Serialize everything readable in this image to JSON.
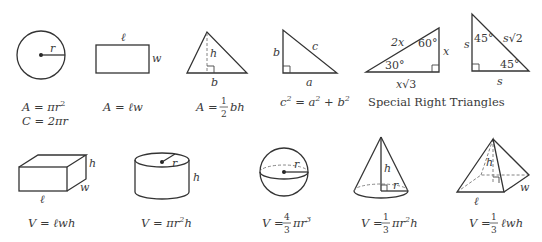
{
  "stroke_color": "#333333",
  "text_color": "#3a3a3a",
  "shapes": {
    "circle": {
      "labels": {
        "radius": "r"
      },
      "formulas": {
        "area_lhs": "A = πr",
        "area_exp": "2",
        "circumference": "C = 2πr"
      }
    },
    "rectangle": {
      "labels": {
        "length": "ℓ",
        "width": "w"
      },
      "formulas": {
        "area": "A = ℓw"
      }
    },
    "triangle": {
      "labels": {
        "height": "h",
        "base": "b"
      },
      "formulas": {
        "area_lhs": "A =",
        "frac_num": "1",
        "frac_den": "2",
        "area_rhs": "bh"
      }
    },
    "right_triangle": {
      "labels": {
        "leg_b": "b",
        "hypotenuse": "c",
        "leg_a": "a"
      },
      "formulas": {
        "c": "c",
        "exp": "2",
        "eq": " = a",
        "plus": " + b"
      }
    },
    "special_30_60_90": {
      "labels": {
        "hypotenuse": "2x",
        "short_leg": "x",
        "long_leg_x": "x",
        "long_leg_root": "√3",
        "angle_a": "30°",
        "angle_b": "60°"
      }
    },
    "special_45_45_90": {
      "labels": {
        "leg_left": "s",
        "leg_bottom": "s",
        "hypotenuse_s": "s",
        "hypotenuse_root": "√2",
        "angle_a": "45°",
        "angle_b": "45°"
      }
    },
    "special_caption": "Special Right Triangles",
    "box": {
      "labels": {
        "length": "ℓ",
        "width": "w",
        "height": "h"
      },
      "formulas": {
        "volume": "V = ℓwh"
      }
    },
    "cylinder": {
      "labels": {
        "radius": "r",
        "height": "h"
      },
      "formulas": {
        "volume_lhs": "V = πr",
        "exp": "2",
        "volume_rhs": "h"
      }
    },
    "sphere": {
      "labels": {
        "radius": "r"
      },
      "formulas": {
        "volume_lhs": "V =",
        "frac_num": "4",
        "frac_den": "3",
        "volume_rhs": "πr",
        "exp": "3"
      }
    },
    "cone": {
      "labels": {
        "height": "h",
        "radius": "r"
      },
      "formulas": {
        "volume_lhs": "V =",
        "frac_num": "1",
        "frac_den": "3",
        "volume_rhs": "πr",
        "exp": "2",
        "volume_tail": "h"
      }
    },
    "pyramid": {
      "labels": {
        "height": "h",
        "length": "ℓ",
        "width": "w"
      },
      "formulas": {
        "volume_lhs": "V =",
        "frac_num": "1",
        "frac_den": "3",
        "volume_rhs": "ℓwh"
      }
    }
  }
}
